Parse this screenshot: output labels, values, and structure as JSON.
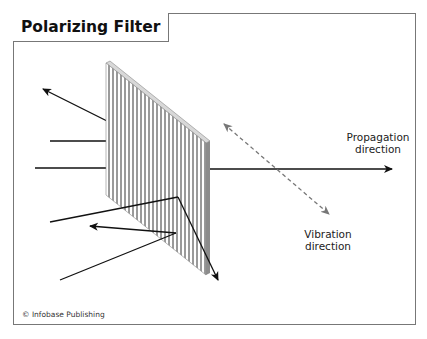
{
  "title": "Polarizing Filter",
  "labels": {
    "propagation_line1": "Propagation",
    "propagation_line2": "direction",
    "vibration_line1": "Vibration",
    "vibration_line2": "direction"
  },
  "copyright": "© Infobase Publishing",
  "colors": {
    "frame_border": "#777777",
    "filter_stripe": "#9a9a9a",
    "filter_edge": "#8c8c8c",
    "arrow": "#111111",
    "vibration_arrow": "#777777"
  },
  "icons": {
    "vibration_arrow": "dashed-double-headed-arrow",
    "propagation_arrow": "solid-arrow-right"
  }
}
